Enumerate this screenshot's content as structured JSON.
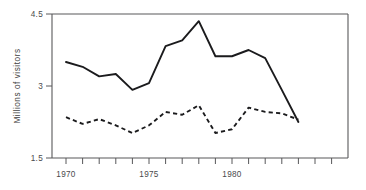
{
  "chart_data": {
    "type": "line",
    "title": "",
    "xlabel": "",
    "ylabel": "Millions of visitors",
    "x": [
      1970,
      1971,
      1972,
      1973,
      1974,
      1975,
      1976,
      1977,
      1978,
      1979,
      1980,
      1981,
      1982,
      1983,
      1984
    ],
    "xlim": [
      1969.2,
      1985.0
    ],
    "ylim": [
      1.5,
      4.5
    ],
    "y_ticks": [
      1.5,
      3,
      4.5
    ],
    "y_tick_labels": [
      "1.5",
      "3",
      "4.5"
    ],
    "x_ticks": [
      1970,
      1971,
      1972,
      1973,
      1974,
      1975,
      1976,
      1977,
      1978,
      1979,
      1980,
      1981,
      1982,
      1983,
      1984
    ],
    "x_tick_labels_shown": [
      "1970",
      "1975",
      "1980"
    ],
    "x_labeled_ticks": [
      1970,
      1975,
      1980
    ],
    "grid": false,
    "legend": "none",
    "series": [
      {
        "name": "solid-series",
        "style": "solid",
        "color": "#1b1b1d",
        "values": [
          3.5,
          3.4,
          3.2,
          3.25,
          2.92,
          3.06,
          3.83,
          3.95,
          4.35,
          3.62,
          3.62,
          3.75,
          3.58,
          2.92,
          2.25
        ]
      },
      {
        "name": "dashed-series",
        "style": "dashed",
        "color": "#1b1b1d",
        "values": [
          2.35,
          2.21,
          2.31,
          2.18,
          2.02,
          2.18,
          2.46,
          2.4,
          2.6,
          2.02,
          2.1,
          2.55,
          2.46,
          2.43,
          2.3
        ]
      }
    ]
  },
  "axis": {
    "y_label": "Millions of visitors",
    "y_tick_top": "4.5",
    "y_tick_mid": "3",
    "y_tick_bottom": "1.5",
    "x_tick_1970": "1970",
    "x_tick_1975": "1975",
    "x_tick_1980": "1980"
  },
  "colors": {
    "line": "#1b1b1d",
    "axis": "#58585a",
    "text": "#4a4a4c",
    "background": "#ffffff"
  }
}
